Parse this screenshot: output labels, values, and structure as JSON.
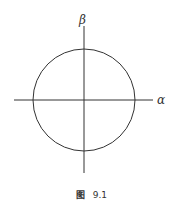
{
  "figure": {
    "axes": {
      "vertical_label": "β",
      "horizontal_label": "α"
    },
    "shape": "circle",
    "caption": {
      "prefix": "图",
      "number": "9.1"
    },
    "colors": {
      "stroke": "#333333",
      "background": "#ffffff"
    }
  }
}
